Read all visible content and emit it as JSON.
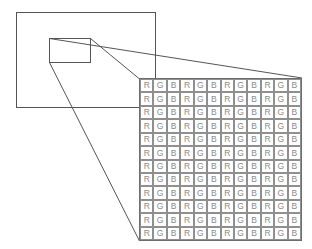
{
  "diagram": {
    "background_color": "#ffffff",
    "line_color": "#555555",
    "sensor_area": {
      "name": "image-sensor-outline",
      "x": 16,
      "y": 12,
      "width": 139,
      "height": 95
    },
    "magnified_region": {
      "name": "magnified-region-outline",
      "x": 49,
      "y": 38,
      "width": 41,
      "height": 24
    },
    "callout_lines": [
      {
        "name": "callout-line-top",
        "x1": 49,
        "y1": 38,
        "x2": 302,
        "y2": 78
      },
      {
        "name": "callout-line-middle",
        "x1": 90,
        "y1": 38,
        "x2": 139,
        "y2": 78
      },
      {
        "name": "callout-line-bottom",
        "x1": 49,
        "y1": 62,
        "x2": 139,
        "y2": 241
      }
    ],
    "grid": {
      "name": "bayer-filter-grid",
      "x": 139,
      "y": 78,
      "width": 163,
      "height": 163,
      "rows": 12,
      "columns": 12,
      "cell_background": "#ffffff",
      "cell_border_color": "#8f8f8f",
      "grid_background": "#8c8c8c",
      "label_color": "#8a8a8a",
      "pattern": [
        "R",
        "G",
        "B"
      ],
      "row_labels": [
        [
          "R",
          "G",
          "B",
          "R",
          "G",
          "B",
          "R",
          "G",
          "B",
          "R",
          "G",
          "B"
        ],
        [
          "R",
          "G",
          "B",
          "R",
          "G",
          "B",
          "R",
          "G",
          "B",
          "R",
          "G",
          "B"
        ],
        [
          "R",
          "G",
          "B",
          "R",
          "G",
          "B",
          "R",
          "G",
          "B",
          "R",
          "G",
          "B"
        ],
        [
          "R",
          "G",
          "B",
          "R",
          "G",
          "B",
          "R",
          "G",
          "B",
          "R",
          "G",
          "B"
        ],
        [
          "R",
          "G",
          "B",
          "R",
          "G",
          "B",
          "R",
          "G",
          "B",
          "R",
          "G",
          "B"
        ],
        [
          "R",
          "G",
          "B",
          "R",
          "G",
          "B",
          "R",
          "G",
          "B",
          "R",
          "G",
          "B"
        ],
        [
          "R",
          "G",
          "B",
          "R",
          "G",
          "B",
          "R",
          "G",
          "B",
          "R",
          "G",
          "B"
        ],
        [
          "R",
          "G",
          "B",
          "R",
          "G",
          "B",
          "R",
          "G",
          "B",
          "R",
          "G",
          "B"
        ],
        [
          "R",
          "G",
          "B",
          "R",
          "G",
          "B",
          "R",
          "G",
          "B",
          "R",
          "G",
          "B"
        ],
        [
          "R",
          "G",
          "B",
          "R",
          "G",
          "B",
          "R",
          "G",
          "B",
          "R",
          "G",
          "B"
        ],
        [
          "R",
          "G",
          "B",
          "R",
          "G",
          "B",
          "R",
          "G",
          "B",
          "R",
          "G",
          "B"
        ],
        [
          "R",
          "G",
          "B",
          "R",
          "G",
          "B",
          "R",
          "G",
          "B",
          "R",
          "G",
          "B"
        ]
      ]
    }
  }
}
